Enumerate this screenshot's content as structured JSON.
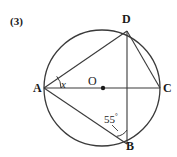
{
  "figure": {
    "problem_number": "(3)",
    "type": "circle-geometry-diagram",
    "background_color": "#ffffff",
    "stroke_color": "#3a3a3a",
    "label_color": "#1a1a1a"
  },
  "labels": {
    "point_A": "A",
    "point_B": "B",
    "point_C": "C",
    "point_D": "D",
    "center_O": "O",
    "angle_x": "x",
    "angle_55_value": "55",
    "angle_55_degree_symbol": "°"
  },
  "geometry": {
    "circle": {
      "center_x": 102,
      "center_y": 88,
      "radius": 58
    },
    "points": {
      "A": {
        "x": 44,
        "y": 88
      },
      "B": {
        "x": 127,
        "y": 144
      },
      "C": {
        "x": 160,
        "y": 88
      },
      "D": {
        "x": 127,
        "y": 31
      },
      "O": {
        "x": 102,
        "y": 88
      }
    },
    "segments": [
      {
        "name": "chord-AD",
        "from": "A",
        "to": "D"
      },
      {
        "name": "diameter-AC",
        "from": "A",
        "to": "C"
      },
      {
        "name": "chord-AB",
        "from": "A",
        "to": "B"
      },
      {
        "name": "chord-DB",
        "from": "D",
        "to": "B"
      },
      {
        "name": "chord-DC",
        "from": "D",
        "to": "C"
      }
    ],
    "angle_marks": [
      {
        "name": "angle-at-A",
        "vertex": "A",
        "label": "x",
        "radius": 17
      },
      {
        "name": "angle-at-B",
        "vertex": "B",
        "label": "55°",
        "radius": 14
      }
    ],
    "center_dot_radius": 2.2
  }
}
